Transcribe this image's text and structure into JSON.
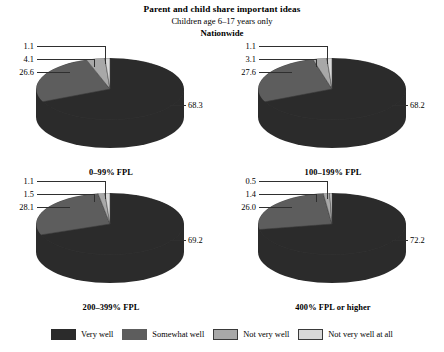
{
  "titles": {
    "main": "Parent and child share important ideas",
    "sub": "Children age 6–17 years only",
    "scope": "Nationwide"
  },
  "legend": {
    "items": [
      {
        "label": "Very well",
        "color": "#2b2b2b"
      },
      {
        "label": "Somewhat well",
        "color": "#5d5d5d"
      },
      {
        "label": "Not very well",
        "color": "#a8a8a8"
      },
      {
        "label": "Not very well at all",
        "color": "#d8d8d8"
      }
    ]
  },
  "chart_data": {
    "type": "pie",
    "title": "Parent and child share important ideas",
    "subtitle": "Children age 6–17 years only",
    "scope": "Nationwide",
    "unit": "percent",
    "categories": [
      "Very well",
      "Somewhat well",
      "Not very well",
      "Not very well at all"
    ],
    "colors": [
      "#2b2b2b",
      "#5d5d5d",
      "#a8a8a8",
      "#d8d8d8"
    ],
    "legend_position": "bottom",
    "panels": [
      {
        "title": "0–99% FPL",
        "values": [
          68.3,
          26.6,
          4.1,
          1.1
        ],
        "labels": {
          "very_well": "68.3",
          "somewhat_well": "26.6",
          "not_very_well": "4.1",
          "not_very_well_at_all": "1.1"
        }
      },
      {
        "title": "100–199% FPL",
        "values": [
          68.2,
          27.6,
          3.1,
          1.1
        ],
        "labels": {
          "very_well": "68.2",
          "somewhat_well": "27.6",
          "not_very_well": "3.1",
          "not_very_well_at_all": "1.1"
        }
      },
      {
        "title": "200–399% FPL",
        "values": [
          69.2,
          28.1,
          1.5,
          1.1
        ],
        "labels": {
          "very_well": "69.2",
          "somewhat_well": "28.1",
          "not_very_well": "1.5",
          "not_very_well_at_all": "1.1"
        }
      },
      {
        "title": "400% FPL or higher",
        "values": [
          72.2,
          26.0,
          1.4,
          0.5
        ],
        "labels": {
          "very_well": "72.2",
          "somewhat_well": "26.0",
          "not_very_well": "1.4",
          "not_very_well_at_all": "0.5"
        }
      }
    ]
  }
}
